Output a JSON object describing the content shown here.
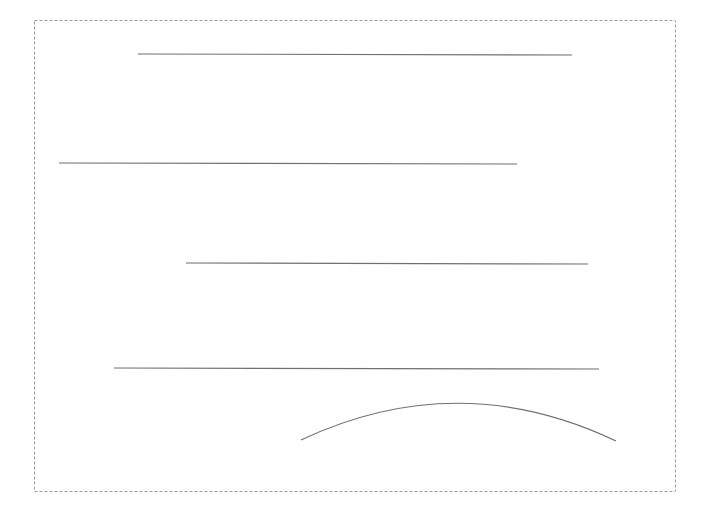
{
  "figure": {
    "border_style": "dashed",
    "border_color": "#9a9a9a",
    "stroke_color": "#707070",
    "shapes": [
      {
        "kind": "line",
        "label": "line-1"
      },
      {
        "kind": "line",
        "label": "line-2"
      },
      {
        "kind": "line",
        "label": "line-3"
      },
      {
        "kind": "line",
        "label": "line-4"
      },
      {
        "kind": "arc",
        "label": "arc-1"
      }
    ]
  }
}
